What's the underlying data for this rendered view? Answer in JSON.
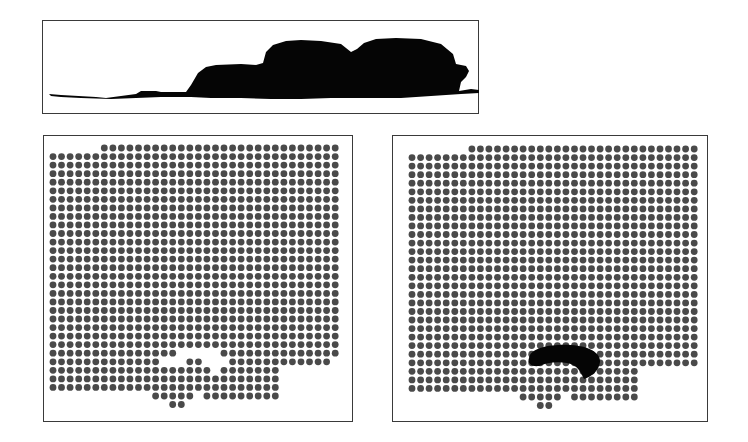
{
  "figure": {
    "panels": [
      {
        "id": "profile",
        "label": "side-profile-silhouette"
      },
      {
        "id": "grid-before",
        "label": "dot-grid-with-void"
      },
      {
        "id": "grid-after",
        "label": "dot-grid-with-dark-blob"
      }
    ]
  },
  "colors": {
    "border": "#3a3a3a",
    "dot": "#4a4a4a",
    "silhouette": "#050505",
    "background": "#ffffff"
  },
  "profile_panel": {
    "box": {
      "x": 42,
      "y": 20,
      "w": 437,
      "h": 94
    }
  },
  "grid_left": {
    "box": {
      "x": 43,
      "y": 135,
      "w": 310,
      "h": 287
    },
    "origin": {
      "x": 52,
      "y": 147
    },
    "pitch": 8.55,
    "rows": [
      {
        "r": 0,
        "spans": [
          [
            6,
            33
          ]
        ]
      },
      {
        "r": 1,
        "spans": [
          [
            0,
            33
          ]
        ]
      },
      {
        "r": 2,
        "spans": [
          [
            0,
            33
          ]
        ]
      },
      {
        "r": 3,
        "spans": [
          [
            0,
            33
          ]
        ]
      },
      {
        "r": 4,
        "spans": [
          [
            0,
            33
          ]
        ]
      },
      {
        "r": 5,
        "spans": [
          [
            0,
            33
          ]
        ]
      },
      {
        "r": 6,
        "spans": [
          [
            0,
            33
          ]
        ]
      },
      {
        "r": 7,
        "spans": [
          [
            0,
            33
          ]
        ]
      },
      {
        "r": 8,
        "spans": [
          [
            0,
            33
          ]
        ]
      },
      {
        "r": 9,
        "spans": [
          [
            0,
            33
          ]
        ]
      },
      {
        "r": 10,
        "spans": [
          [
            0,
            33
          ]
        ]
      },
      {
        "r": 11,
        "spans": [
          [
            0,
            33
          ]
        ]
      },
      {
        "r": 12,
        "spans": [
          [
            0,
            33
          ]
        ]
      },
      {
        "r": 13,
        "spans": [
          [
            0,
            33
          ]
        ]
      },
      {
        "r": 14,
        "spans": [
          [
            0,
            33
          ]
        ]
      },
      {
        "r": 15,
        "spans": [
          [
            0,
            33
          ]
        ]
      },
      {
        "r": 16,
        "spans": [
          [
            0,
            33
          ]
        ]
      },
      {
        "r": 17,
        "spans": [
          [
            0,
            33
          ]
        ]
      },
      {
        "r": 18,
        "spans": [
          [
            0,
            33
          ]
        ]
      },
      {
        "r": 19,
        "spans": [
          [
            0,
            33
          ]
        ]
      },
      {
        "r": 20,
        "spans": [
          [
            0,
            33
          ]
        ]
      },
      {
        "r": 21,
        "spans": [
          [
            0,
            33
          ]
        ]
      },
      {
        "r": 22,
        "spans": [
          [
            0,
            33
          ]
        ]
      },
      {
        "r": 23,
        "spans": [
          [
            0,
            33
          ]
        ]
      },
      {
        "r": 24,
        "spans": [
          [
            0,
            14
          ],
          [
            20,
            33
          ]
        ]
      },
      {
        "r": 25,
        "spans": [
          [
            0,
            12
          ],
          [
            16,
            17
          ],
          [
            21,
            32
          ]
        ]
      },
      {
        "r": 26,
        "spans": [
          [
            0,
            18
          ],
          [
            20,
            26
          ]
        ]
      },
      {
        "r": 27,
        "spans": [
          [
            0,
            26
          ]
        ]
      },
      {
        "r": 28,
        "spans": [
          [
            0,
            26
          ]
        ]
      },
      {
        "r": 29,
        "spans": [
          [
            12,
            16
          ],
          [
            18,
            26
          ]
        ]
      },
      {
        "r": 30,
        "spans": [
          [
            14,
            15
          ]
        ]
      }
    ]
  },
  "grid_right": {
    "box": {
      "x": 392,
      "y": 135,
      "w": 316,
      "h": 287
    },
    "origin": {
      "x": 411,
      "y": 148
    },
    "pitch": 8.55,
    "rows": [
      {
        "r": 0,
        "spans": [
          [
            7,
            33
          ]
        ]
      },
      {
        "r": 1,
        "spans": [
          [
            0,
            33
          ]
        ]
      },
      {
        "r": 2,
        "spans": [
          [
            0,
            33
          ]
        ]
      },
      {
        "r": 3,
        "spans": [
          [
            0,
            33
          ]
        ]
      },
      {
        "r": 4,
        "spans": [
          [
            0,
            33
          ]
        ]
      },
      {
        "r": 5,
        "spans": [
          [
            0,
            33
          ]
        ]
      },
      {
        "r": 6,
        "spans": [
          [
            0,
            33
          ]
        ]
      },
      {
        "r": 7,
        "spans": [
          [
            0,
            33
          ]
        ]
      },
      {
        "r": 8,
        "spans": [
          [
            0,
            33
          ]
        ]
      },
      {
        "r": 9,
        "spans": [
          [
            0,
            33
          ]
        ]
      },
      {
        "r": 10,
        "spans": [
          [
            0,
            33
          ]
        ]
      },
      {
        "r": 11,
        "spans": [
          [
            0,
            33
          ]
        ]
      },
      {
        "r": 12,
        "spans": [
          [
            0,
            33
          ]
        ]
      },
      {
        "r": 13,
        "spans": [
          [
            0,
            33
          ]
        ]
      },
      {
        "r": 14,
        "spans": [
          [
            0,
            33
          ]
        ]
      },
      {
        "r": 15,
        "spans": [
          [
            0,
            33
          ]
        ]
      },
      {
        "r": 16,
        "spans": [
          [
            0,
            33
          ]
        ]
      },
      {
        "r": 17,
        "spans": [
          [
            0,
            33
          ]
        ]
      },
      {
        "r": 18,
        "spans": [
          [
            0,
            33
          ]
        ]
      },
      {
        "r": 19,
        "spans": [
          [
            0,
            33
          ]
        ]
      },
      {
        "r": 20,
        "spans": [
          [
            0,
            33
          ]
        ]
      },
      {
        "r": 21,
        "spans": [
          [
            0,
            33
          ]
        ]
      },
      {
        "r": 22,
        "spans": [
          [
            0,
            33
          ]
        ]
      },
      {
        "r": 23,
        "spans": [
          [
            0,
            33
          ]
        ]
      },
      {
        "r": 24,
        "spans": [
          [
            0,
            33
          ]
        ]
      },
      {
        "r": 25,
        "spans": [
          [
            0,
            33
          ]
        ]
      },
      {
        "r": 26,
        "spans": [
          [
            0,
            26
          ]
        ]
      },
      {
        "r": 27,
        "spans": [
          [
            0,
            26
          ]
        ]
      },
      {
        "r": 28,
        "spans": [
          [
            0,
            26
          ]
        ]
      },
      {
        "r": 29,
        "spans": [
          [
            13,
            17
          ],
          [
            19,
            26
          ]
        ]
      },
      {
        "r": 30,
        "spans": [
          [
            15,
            16
          ]
        ]
      }
    ],
    "blob": "M 528 357 C 530 346, 552 343, 570 344 C 588 345, 600 352, 599 361 C 598 370, 590 376, 583 378 C 580 372, 577 364, 566 362 C 555 360, 545 362, 538 365 C 530 366, 526 362, 528 357 Z"
  },
  "profile_shape": "M 48 93 L 60 94 L 95 96 L 105 97 L 120 95 L 135 93 L 140 90 L 155 90 L 160 91 L 185 91 L 190 84 L 197 72 L 205 66 L 215 64 L 240 63 L 255 64 L 262 62 L 265 51 L 272 44 L 285 40 L 300 39 L 320 40 L 340 43 L 350 51 L 356 48 L 363 42 L 375 38 L 395 37 L 420 38 L 440 43 L 452 53 L 455 63 L 465 65 L 468 70 L 465 76 L 460 81 L 458 90 L 470 88 L 478 89 L 478 92 L 460 93 L 430 95 L 400 97 L 360 97 L 330 97 L 300 98 L 270 98 L 240 97 L 210 97 L 190 96 L 160 96 L 135 97 L 110 98 L 80 97 L 60 96 L 50 95 Z"
}
